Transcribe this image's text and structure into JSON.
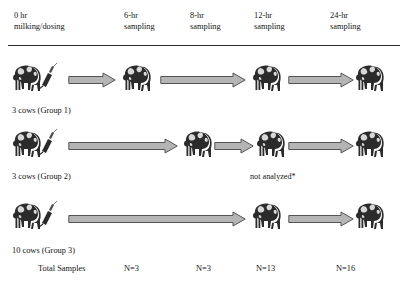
{
  "figure": {
    "type": "study-timeline-diagram",
    "background": "#ffffff",
    "arrow_fill": "#b5b5b5",
    "arrow_stroke": "#555555",
    "cow_dark": "#2b2b2b",
    "cow_light": "#d8d8d8",
    "rule_color": "#2a2a2a"
  },
  "columns": [
    {
      "id": "t0",
      "line1": "0 hr",
      "line2": "milking/dosing",
      "x": 14
    },
    {
      "id": "t6",
      "line1": "6-hr",
      "line2": "sampling",
      "x": 124
    },
    {
      "id": "t8",
      "line1": "8-hr",
      "line2": "sampling",
      "x": 190
    },
    {
      "id": "t12",
      "line1": "12-hr",
      "line2": "sampling",
      "x": 254
    },
    {
      "id": "t24",
      "line1": "24-hr",
      "line2": "sampling",
      "x": 330
    }
  ],
  "rows": [
    {
      "id": "group1",
      "label": "3 cows (Group 1)",
      "label_x": 12,
      "label_y": 106,
      "cow_y": 62,
      "arrow_y": 72,
      "dosed": true,
      "cows": [
        {
          "at": "t0",
          "x": 12
        },
        {
          "at": "t6",
          "x": 122
        },
        {
          "at": "t12",
          "x": 252
        },
        {
          "at": "t24",
          "x": 355
        }
      ],
      "arrows": [
        {
          "x": 68,
          "width": 48
        },
        {
          "x": 160,
          "width": 86
        },
        {
          "x": 288,
          "width": 66
        }
      ]
    },
    {
      "id": "group2",
      "label": "3 cows (Group 2)",
      "label_x": 12,
      "label_y": 172,
      "cow_y": 128,
      "arrow_y": 138,
      "dosed": true,
      "cows": [
        {
          "at": "t0",
          "x": 12
        },
        {
          "at": "t8",
          "x": 183
        },
        {
          "at": "t12",
          "x": 256
        },
        {
          "at": "t24",
          "x": 355
        }
      ],
      "arrows": [
        {
          "x": 68,
          "width": 110
        },
        {
          "x": 214,
          "width": 40
        },
        {
          "x": 288,
          "width": 66
        }
      ]
    },
    {
      "id": "group3",
      "label": "10 cows (Group 3)",
      "label_x": 12,
      "label_y": 246,
      "cow_y": 200,
      "arrow_y": 211,
      "dosed": true,
      "cows": [
        {
          "at": "t0",
          "x": 12
        },
        {
          "at": "t12",
          "x": 252
        },
        {
          "at": "t24",
          "x": 355
        }
      ],
      "arrows": [
        {
          "x": 68,
          "width": 178
        },
        {
          "x": 288,
          "width": 66
        }
      ]
    }
  ],
  "annotation": {
    "not_analyzed": "not analyzed*",
    "x": 250,
    "y": 172
  },
  "totals": {
    "label": "Total Samples",
    "label_x": 38,
    "y": 264,
    "cells": [
      {
        "at": "t6",
        "value": "N=3",
        "x": 124
      },
      {
        "at": "t8",
        "value": "N=3",
        "x": 196
      },
      {
        "at": "t12",
        "value": "N=13",
        "x": 256
      },
      {
        "at": "t24",
        "value": "N=16",
        "x": 336
      }
    ]
  }
}
